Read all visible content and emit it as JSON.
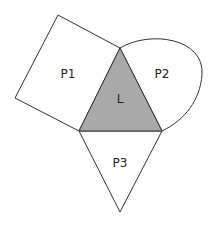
{
  "diagram": {
    "shapes": [
      {
        "id": "L",
        "label": "L",
        "kind": "triangle",
        "fill": "#a9a9a9"
      },
      {
        "id": "P1",
        "label": "P1",
        "kind": "square",
        "fill": "#ffffff"
      },
      {
        "id": "P2",
        "label": "P2",
        "kind": "curved-region",
        "fill": "#ffffff"
      },
      {
        "id": "P3",
        "label": "P3",
        "kind": "triangle",
        "fill": "#ffffff"
      }
    ],
    "stroke_color": "#333333"
  }
}
